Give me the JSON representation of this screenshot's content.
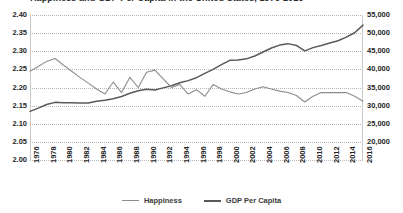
{
  "title": "Happiness and GDP Per Capita in the United States, 1976-2016",
  "legend": {
    "happiness_label": "Happiness",
    "gdp_label": "GDP Per Capita"
  },
  "colors": {
    "happiness": "#8d8d8d",
    "gdp": "#595959",
    "grid": "#b8b8b8",
    "text": "#262626",
    "background": "#ffffff"
  },
  "chart_data": {
    "type": "line",
    "title": "Happiness and GDP Per Capita in the United States, 1976-2016",
    "xlabel": "",
    "ylabel": "",
    "grid": true,
    "legend_position": "bottom",
    "xlim": [
      1976,
      2016
    ],
    "x_tick_step": 2,
    "x_tick_labels": [
      "1976",
      "1978",
      "1980",
      "1982",
      "1984",
      "1986",
      "1988",
      "1990",
      "1992",
      "1994",
      "1996",
      "1998",
      "2000",
      "2002",
      "2004",
      "2006",
      "2008",
      "2010",
      "2012",
      "2014",
      "2016"
    ],
    "left_axis": {
      "name": "Happiness",
      "ylim": [
        2.0,
        2.4
      ],
      "tick_step": 0.05,
      "tick_labels": [
        "2.00",
        "2.05",
        "2.10",
        "2.15",
        "2.20",
        "2.25",
        "2.30",
        "2.35",
        "2.40"
      ]
    },
    "right_axis": {
      "name": "GDP Per Capita",
      "ylim": [
        20000,
        55000
      ],
      "tick_step": 5000,
      "tick_labels": [
        "20,000",
        "25,000",
        "30,000",
        "35,000",
        "40,000",
        "45,000",
        "50,000",
        "55,000"
      ]
    },
    "x": [
      1976,
      1977,
      1978,
      1979,
      1980,
      1981,
      1982,
      1983,
      1984,
      1985,
      1986,
      1987,
      1988,
      1989,
      1990,
      1991,
      1992,
      1993,
      1994,
      1995,
      1996,
      1997,
      1998,
      1999,
      2000,
      2001,
      2002,
      2003,
      2004,
      2005,
      2006,
      2007,
      2008,
      2009,
      2010,
      2011,
      2012,
      2013,
      2014,
      2015,
      2016
    ],
    "series": [
      {
        "name": "Happiness",
        "axis": "left",
        "values": [
          2.245,
          2.258,
          2.272,
          2.28,
          2.262,
          2.245,
          2.228,
          2.212,
          2.196,
          2.182,
          2.215,
          2.186,
          2.228,
          2.2,
          2.242,
          2.248,
          2.224,
          2.2,
          2.208,
          2.182,
          2.194,
          2.176,
          2.208,
          2.196,
          2.188,
          2.182,
          2.186,
          2.196,
          2.202,
          2.196,
          2.19,
          2.186,
          2.178,
          2.16,
          2.176,
          2.186,
          2.186,
          2.186,
          2.186,
          2.176,
          2.162
        ]
      },
      {
        "name": "GDP Per Capita",
        "axis": "right",
        "values": [
          28400,
          29300,
          30300,
          30900,
          30800,
          30800,
          30700,
          30750,
          31200,
          31500,
          31900,
          32500,
          33400,
          34100,
          34500,
          34300,
          34900,
          35500,
          36300,
          36900,
          37700,
          38900,
          40000,
          41300,
          42500,
          42600,
          42900,
          43700,
          44800,
          45900,
          46700,
          47100,
          46600,
          45100,
          46000,
          46600,
          47300,
          47900,
          48900,
          50100,
          52200
        ]
      }
    ]
  }
}
